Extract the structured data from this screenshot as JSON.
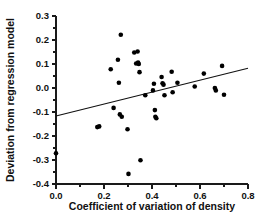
{
  "chart_data": {
    "type": "scatter",
    "title": "",
    "xlabel": "Coefficient of variation of density",
    "ylabel": "Deviation from regression model",
    "xlim": [
      0.0,
      0.8
    ],
    "ylim": [
      -0.4,
      0.3
    ],
    "xticks": [
      0.0,
      0.2,
      0.4,
      0.6,
      0.8
    ],
    "xtick_labels": [
      "0.0",
      "0.2",
      "0.4",
      "0.6",
      "0.8"
    ],
    "yticks": [
      -0.4,
      -0.3,
      -0.2,
      -0.1,
      0.0,
      0.1,
      0.2,
      0.3
    ],
    "ytick_labels": [
      "-0.4",
      "-0.3",
      "-0.2",
      "-0.1",
      "0.0",
      "0.1",
      "0.2",
      "0.3"
    ],
    "xminor_ticks": [
      0.1,
      0.3,
      0.5,
      0.7
    ],
    "yminor_ticks": [
      -0.35,
      -0.25,
      -0.15,
      -0.05,
      0.05,
      0.15,
      0.25
    ],
    "grid": false,
    "legend": null,
    "marker": "filled-circle",
    "marker_color": "#000000",
    "marker_size_px": 4.6,
    "points": [
      {
        "x": 0.0,
        "y": -0.272
      },
      {
        "x": 0.172,
        "y": -0.163
      },
      {
        "x": 0.18,
        "y": -0.16
      },
      {
        "x": 0.228,
        "y": 0.078
      },
      {
        "x": 0.24,
        "y": -0.083
      },
      {
        "x": 0.258,
        "y": 0.118
      },
      {
        "x": 0.262,
        "y": 0.022
      },
      {
        "x": 0.266,
        "y": -0.11
      },
      {
        "x": 0.27,
        "y": 0.222
      },
      {
        "x": 0.274,
        "y": -0.12
      },
      {
        "x": 0.298,
        "y": -0.172
      },
      {
        "x": 0.302,
        "y": -0.358
      },
      {
        "x": 0.326,
        "y": 0.148
      },
      {
        "x": 0.334,
        "y": 0.102
      },
      {
        "x": 0.34,
        "y": 0.152
      },
      {
        "x": 0.342,
        "y": 0.106
      },
      {
        "x": 0.345,
        "y": 0.1
      },
      {
        "x": 0.348,
        "y": 0.066
      },
      {
        "x": 0.352,
        "y": -0.301
      },
      {
        "x": 0.372,
        "y": -0.03
      },
      {
        "x": 0.404,
        "y": -0.01
      },
      {
        "x": 0.408,
        "y": 0.018
      },
      {
        "x": 0.412,
        "y": -0.092
      },
      {
        "x": 0.414,
        "y": -0.12
      },
      {
        "x": 0.418,
        "y": -0.126
      },
      {
        "x": 0.44,
        "y": 0.046
      },
      {
        "x": 0.444,
        "y": 0.02
      },
      {
        "x": 0.448,
        "y": 0.014
      },
      {
        "x": 0.452,
        "y": -0.03
      },
      {
        "x": 0.482,
        "y": 0.068
      },
      {
        "x": 0.486,
        "y": -0.018
      },
      {
        "x": 0.506,
        "y": 0.022
      },
      {
        "x": 0.578,
        "y": 0.006
      },
      {
        "x": 0.616,
        "y": 0.06
      },
      {
        "x": 0.662,
        "y": 0.0
      },
      {
        "x": 0.666,
        "y": -0.01
      },
      {
        "x": 0.692,
        "y": 0.092
      },
      {
        "x": 0.7,
        "y": -0.028
      }
    ],
    "regression_line": {
      "x_start": 0.0,
      "y_start": -0.117,
      "x_end": 0.8,
      "y_end": 0.082,
      "slope": 0.249,
      "intercept": -0.117,
      "color": "#111111"
    }
  }
}
